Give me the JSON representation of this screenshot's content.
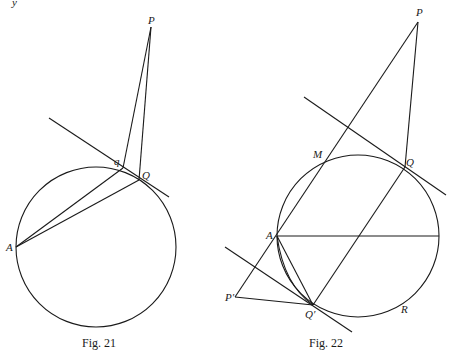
{
  "figures": [
    {
      "caption": "Fig. 21",
      "circle": {
        "cx": 96,
        "cy": 247,
        "r": 80
      },
      "points": {
        "P": {
          "label": "P",
          "x": 151,
          "y": 27
        },
        "q": {
          "label": "q",
          "x": 123,
          "y": 168
        },
        "Q": {
          "label": "Q",
          "x": 139,
          "y": 180
        },
        "A": {
          "label": "A",
          "x": 16,
          "y": 247
        }
      },
      "segments": [
        {
          "name": "tangent-line",
          "x1": 49,
          "y1": 118,
          "x2": 169,
          "y2": 197
        },
        {
          "name": "segment-Pq",
          "x1": 151,
          "y1": 27,
          "x2": 123,
          "y2": 168
        },
        {
          "name": "segment-PQ",
          "x1": 151,
          "y1": 27,
          "x2": 139,
          "y2": 180
        },
        {
          "name": "segment-Aq",
          "x1": 16,
          "y1": 247,
          "x2": 123,
          "y2": 168
        },
        {
          "name": "segment-AQ",
          "x1": 16,
          "y1": 247,
          "x2": 139,
          "y2": 180
        }
      ]
    },
    {
      "caption": "Fig. 22",
      "circle": {
        "cx": 358,
        "cy": 236,
        "r": 81
      },
      "points": {
        "P": {
          "label": "P",
          "x": 418,
          "y": 22
        },
        "M": {
          "label": "M",
          "x": 326,
          "y": 158
        },
        "Q": {
          "label": "Q",
          "x": 405,
          "y": 167
        },
        "A": {
          "label": "A",
          "x": 277,
          "y": 236
        },
        "P_prime": {
          "label": "P′",
          "x": 235,
          "y": 297
        },
        "Q_prime": {
          "label": "Q′",
          "x": 313,
          "y": 305
        },
        "R": {
          "label": "R",
          "x": 405,
          "y": 310
        }
      },
      "segments": [
        {
          "name": "line-P-Pprime",
          "x1": 418,
          "y1": 22,
          "x2": 235,
          "y2": 297
        },
        {
          "name": "segment-PQ",
          "x1": 418,
          "y1": 22,
          "x2": 405,
          "y2": 167
        },
        {
          "name": "upper-tangent",
          "x1": 304,
          "y1": 97,
          "x2": 446,
          "y2": 195
        },
        {
          "name": "diameter-A",
          "x1": 277,
          "y1": 236,
          "x2": 439,
          "y2": 236
        },
        {
          "name": "segment-Q-Qprime",
          "x1": 405,
          "y1": 167,
          "x2": 313,
          "y2": 305
        },
        {
          "name": "segment-A-Qprime",
          "x1": 277,
          "y1": 236,
          "x2": 313,
          "y2": 305
        },
        {
          "name": "segment-Pprime-Qprime",
          "x1": 235,
          "y1": 297,
          "x2": 313,
          "y2": 305
        },
        {
          "name": "lower-tangent",
          "x1": 225,
          "y1": 247,
          "x2": 352,
          "y2": 332
        }
      ],
      "arc": {
        "name": "inner-arc-A-Qprime",
        "d": "M277,236 Q284,285 313,305"
      }
    }
  ],
  "page_marks": {
    "corner_glyph": "y"
  }
}
